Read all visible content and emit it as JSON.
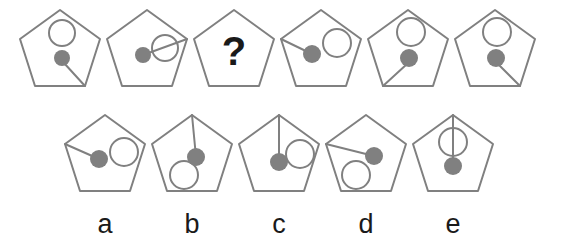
{
  "puzzle": {
    "type": "visual-analogy-matrix",
    "shape": "pentagon",
    "colors": {
      "stroke": "#808080",
      "fill_dot": "#808080",
      "ring_fill": "none",
      "text": "#1a1a1a",
      "background": "#ffffff"
    },
    "question_mark": "?",
    "sequence_row": {
      "label": "sequence",
      "items": [
        {
          "id": "seq-1",
          "name": "pentagon-1",
          "ring": "top-center",
          "dot": "center",
          "line": "dot-to-bottom-right-vertex",
          "text": ""
        },
        {
          "id": "seq-2",
          "name": "pentagon-2",
          "ring": "center-right",
          "dot": "center-left",
          "line": "dot-through-ring-to-right-vertex",
          "text": ""
        },
        {
          "id": "seq-3",
          "name": "pentagon-3-missing",
          "ring": "none",
          "dot": "none",
          "line": "none",
          "text": "?"
        },
        {
          "id": "seq-4",
          "name": "pentagon-4",
          "ring": "upper-right",
          "dot": "center",
          "line": "dot-to-left-vertex",
          "text": ""
        },
        {
          "id": "seq-5",
          "name": "pentagon-5",
          "ring": "top-center",
          "dot": "center",
          "line": "dot-to-bottom-left-vertex",
          "text": ""
        },
        {
          "id": "seq-6",
          "name": "pentagon-6",
          "ring": "top-center",
          "dot": "center",
          "line": "dot-to-bottom-right-vertex",
          "text": ""
        }
      ]
    },
    "options_row": {
      "label": "answer-options",
      "items": [
        {
          "id": "opt-a",
          "label": "a",
          "ring": "center-right",
          "dot": "center",
          "line": "dot-to-left-vertex"
        },
        {
          "id": "opt-b",
          "label": "b",
          "ring": "lower-left",
          "dot": "center",
          "line": "top-vertex-to-dot"
        },
        {
          "id": "opt-c",
          "label": "c",
          "ring": "center-right",
          "dot": "center",
          "line": "top-vertex-to-dot"
        },
        {
          "id": "opt-d",
          "label": "d",
          "ring": "lower-left",
          "dot": "center-right",
          "line": "left-vertex-to-dot"
        },
        {
          "id": "opt-e",
          "label": "e",
          "ring": "upper-center",
          "dot": "center",
          "line": "top-vertex-through-ring-to-dot"
        }
      ]
    }
  }
}
